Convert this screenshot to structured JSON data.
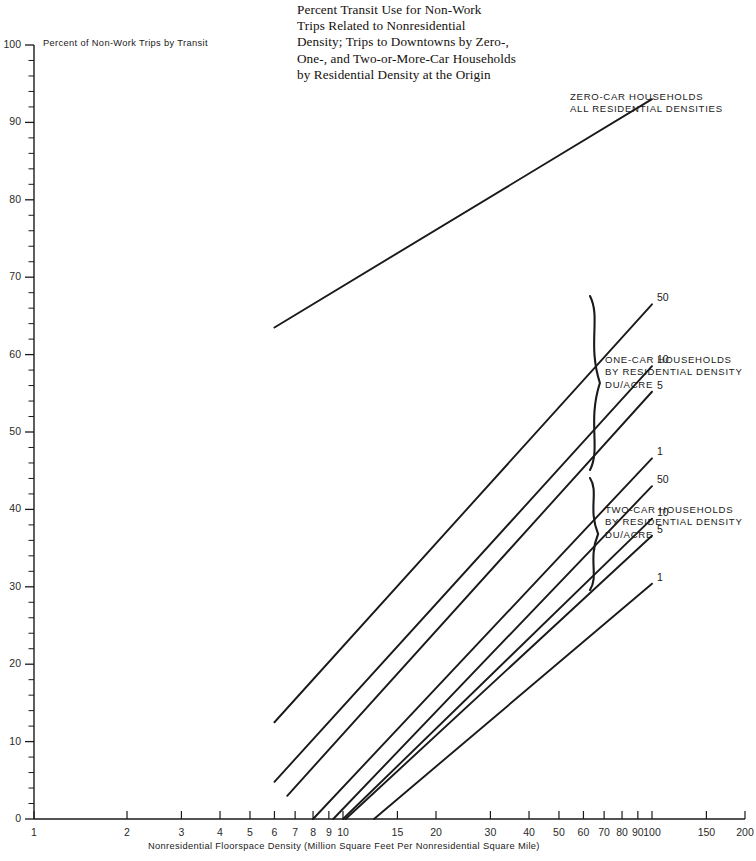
{
  "figure": {
    "title_lines": [
      "Percent Transit Use for Non-Work",
      "Trips Related to Nonresidential",
      "Density; Trips to Downtowns by Zero-,",
      "One-, and Two-or-More-Car Households",
      "by Residential Density at the Origin"
    ],
    "ylabel": "Percent of Non-Work Trips by Transit",
    "xlabel": "Nonresidential Floorspace Density (Million Square Feet Per Nonresidential Square Mile)",
    "ink_color": "#1a1a1a",
    "background": "#ffffff"
  },
  "annotations": {
    "zero_car": [
      "ZERO-CAR HOUSEHOLDS",
      "ALL RESIDENTIAL DENSITIES"
    ],
    "one_car": [
      "ONE-CAR HOUSEHOLDS",
      "BY RESIDENTIAL DENSITY",
      "DU/ACRE"
    ],
    "two_car": [
      "TWO-CAR HOUSEHOLDS",
      "BY RESIDENTIAL DENSITY",
      "DU/ACRE"
    ]
  },
  "chart_data": {
    "type": "line",
    "title": "Percent Transit Use for Non-Work Trips Related to Nonresidential Density; Trips to Downtowns by Zero-, One-, and Two-or-More-Car Households by Residential Density at the Origin",
    "xlabel": "Nonresidential Floorspace Density (Million Square Feet Per Nonresidential Square Mile)",
    "ylabel": "Percent of Non-Work Trips by Transit",
    "xscale": "log",
    "yscale": "linear",
    "xlim": [
      1,
      200
    ],
    "ylim": [
      0,
      100
    ],
    "grid": false,
    "legend": "inline-labels-right",
    "xticks_major": [
      1,
      2,
      3,
      4,
      5,
      6,
      7,
      8,
      9,
      10,
      15,
      20,
      30,
      40,
      50,
      60,
      70,
      80,
      90,
      100,
      150,
      200
    ],
    "xtick_labels": [
      "1",
      "2",
      "3",
      "4",
      "5",
      "6",
      "7",
      "8",
      "9",
      "10",
      "15",
      "20",
      "30",
      "40",
      "50",
      "60",
      "70",
      "80",
      "90",
      "100",
      "150",
      "200"
    ],
    "yticks_major": [
      0,
      10,
      20,
      30,
      40,
      50,
      60,
      70,
      80,
      90,
      100
    ],
    "ytick_labels": [
      "0",
      "10",
      "20",
      "30",
      "40",
      "50",
      "60",
      "70",
      "80",
      "90",
      "100"
    ],
    "ytick_minor_step": 2,
    "series": [
      {
        "name": "Zero-car households, all residential densities",
        "group": "zero-car",
        "point_label": "",
        "x": [
          6.0,
          100.0
        ],
        "y": [
          63.5,
          93.0
        ]
      },
      {
        "name": "One-car households, 50 DU/acre",
        "group": "one-car",
        "point_label": "50",
        "x": [
          6.0,
          100.0
        ],
        "y": [
          12.5,
          66.5
        ]
      },
      {
        "name": "One-car households, 10 DU/acre",
        "group": "one-car",
        "point_label": "10",
        "x": [
          6.0,
          100.0
        ],
        "y": [
          4.8,
          58.5
        ]
      },
      {
        "name": "One-car households, 5 DU/acre",
        "group": "one-car",
        "point_label": "5",
        "x": [
          6.6,
          100.0
        ],
        "y": [
          3.0,
          55.2
        ]
      },
      {
        "name": "One-car households, 1 DU/acre",
        "group": "one-car",
        "point_label": "1",
        "x": [
          8.0,
          100.0
        ],
        "y": [
          0.0,
          46.6
        ]
      },
      {
        "name": "Two-car households, 50 DU/acre",
        "group": "two-car",
        "point_label": "50",
        "x": [
          9.3,
          100.0
        ],
        "y": [
          0.0,
          43.0
        ]
      },
      {
        "name": "Two-car households, 10 DU/acre",
        "group": "two-car",
        "point_label": "10",
        "x": [
          10.0,
          100.0
        ],
        "y": [
          0.0,
          38.8
        ]
      },
      {
        "name": "Two-car households, 5 DU/acre",
        "group": "two-car",
        "point_label": "5",
        "x": [
          10.2,
          100.0
        ],
        "y": [
          0.0,
          36.6
        ]
      },
      {
        "name": "Two-car households, 1 DU/acre",
        "group": "two-car",
        "point_label": "1",
        "x": [
          12.6,
          100.0
        ],
        "y": [
          0.0,
          30.4
        ]
      }
    ]
  }
}
